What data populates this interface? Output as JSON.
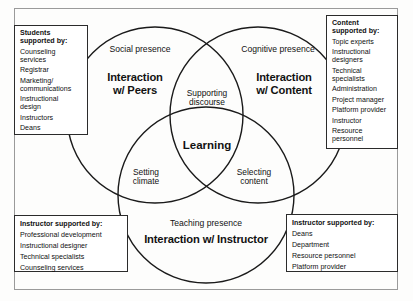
{
  "diagram": {
    "circles": [
      {
        "id": "social",
        "presence": "Social presence",
        "interaction": "Interaction w/ Peers"
      },
      {
        "id": "cognitive",
        "presence": "Cognitive presence",
        "interaction": "Interaction w/ Content"
      },
      {
        "id": "teaching",
        "presence": "Teaching presence",
        "interaction": "Interaction w/ Instructor"
      }
    ],
    "overlaps": {
      "social_cognitive": "Supporting discourse",
      "social_teaching": "Setting climate",
      "cognitive_teaching": "Selecting content",
      "center": "Learning"
    },
    "overlap_lines": {
      "supporting_discourse": [
        "Supporting",
        "discourse"
      ],
      "setting_climate": [
        "Setting",
        "climate"
      ],
      "selecting_content": [
        "Selecting",
        "content"
      ]
    },
    "interaction_lines": {
      "peers": [
        "Interaction",
        "w/ Peers"
      ],
      "content": [
        "Interaction",
        "w/ Content"
      ],
      "instructor": [
        "Interaction w/ Instructor"
      ]
    },
    "colors": {
      "stroke": "#1a1a1a",
      "box_border": "#2b2b2b",
      "frame_border": "#9a9a9a",
      "text": "#121212",
      "background": "#fdfdfc"
    }
  },
  "boxes": {
    "students": {
      "header_lines": [
        "Students",
        "supported by:"
      ],
      "header": "Students supported by:",
      "items": [
        "Counseling services",
        "Registrar",
        "Marketing/ communications",
        "Instructional design",
        "Instructors",
        "Deans"
      ],
      "item_lines": [
        [
          "Counseling",
          "services"
        ],
        [
          "Registrar"
        ],
        [
          "Marketing/",
          "communications"
        ],
        [
          "Instructional",
          "design"
        ],
        [
          "Instructors"
        ],
        [
          "Deans"
        ]
      ]
    },
    "content": {
      "header_lines": [
        "Content",
        "supported by:"
      ],
      "header": "Content supported by:",
      "items": [
        "Topic experts",
        "Instructional designers",
        "Technical specialists",
        "Administration",
        "Project manager",
        "Platform provider",
        "Instructor",
        "Resource personnel"
      ],
      "item_lines": [
        [
          "Topic experts"
        ],
        [
          "Instructional",
          "designers"
        ],
        [
          "Technical",
          "specialists"
        ],
        [
          "Administration"
        ],
        [
          "Project manager"
        ],
        [
          "Platform provider"
        ],
        [
          "Instructor"
        ],
        [
          "Resource",
          "personnel"
        ]
      ]
    },
    "instructor_left": {
      "header": "Instructor supported by:",
      "items": [
        "Professional development",
        "Instructional designer",
        "Technical specialists",
        "Counseling services"
      ]
    },
    "instructor_right": {
      "header": "Instructor supported by:",
      "items": [
        "Deans",
        "Department",
        "Resource personnel",
        "Platform provider"
      ]
    }
  }
}
